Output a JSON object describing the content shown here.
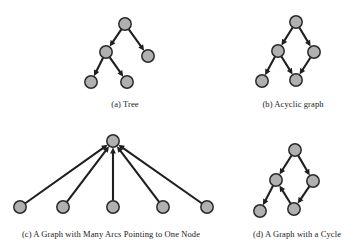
{
  "figure": {
    "background": "#ffffff",
    "node_fill": "#b0b0b0",
    "node_stroke": "#2a2a2a",
    "edge_color": "#1f1f1f",
    "node_radius": 6.2,
    "panels": [
      {
        "id": "a",
        "caption": "(a) Tree",
        "kind": "tree",
        "nodes": [
          {
            "id": "n1",
            "x": 125,
            "y": 24
          },
          {
            "id": "n2",
            "x": 106,
            "y": 52
          },
          {
            "id": "n3",
            "x": 148,
            "y": 56
          },
          {
            "id": "n4",
            "x": 91,
            "y": 82
          },
          {
            "id": "n5",
            "x": 127,
            "y": 82
          }
        ],
        "edges": [
          {
            "from": "n1",
            "to": "n2",
            "directed": true
          },
          {
            "from": "n1",
            "to": "n3",
            "directed": true
          },
          {
            "from": "n2",
            "to": "n4",
            "directed": true
          },
          {
            "from": "n2",
            "to": "n5",
            "directed": true
          }
        ]
      },
      {
        "id": "b",
        "caption": "(b) Acyclic graph",
        "kind": "acyclic",
        "nodes": [
          {
            "id": "n1",
            "x": 296,
            "y": 22
          },
          {
            "id": "n2",
            "x": 278,
            "y": 51
          },
          {
            "id": "n3",
            "x": 314,
            "y": 52
          },
          {
            "id": "n4",
            "x": 296,
            "y": 80
          },
          {
            "id": "n5",
            "x": 262,
            "y": 81
          }
        ],
        "edges": [
          {
            "from": "n1",
            "to": "n2",
            "directed": true
          },
          {
            "from": "n1",
            "to": "n3",
            "directed": true
          },
          {
            "from": "n2",
            "to": "n5",
            "directed": true
          },
          {
            "from": "n2",
            "to": "n4",
            "directed": true
          },
          {
            "from": "n3",
            "to": "n4",
            "directed": true
          }
        ]
      },
      {
        "id": "c",
        "caption": "(c) A Graph with Many Arcs Pointing to One Node",
        "kind": "in-hub",
        "nodes": [
          {
            "id": "hub",
            "x": 113,
            "y": 141
          },
          {
            "id": "l1",
            "x": 20,
            "y": 207
          },
          {
            "id": "l2",
            "x": 63,
            "y": 207
          },
          {
            "id": "l3",
            "x": 113,
            "y": 207
          },
          {
            "id": "l4",
            "x": 163,
            "y": 207
          },
          {
            "id": "l5",
            "x": 207,
            "y": 207
          }
        ],
        "edges": [
          {
            "from": "l1",
            "to": "hub",
            "directed": true
          },
          {
            "from": "l2",
            "to": "hub",
            "directed": true
          },
          {
            "from": "l3",
            "to": "hub",
            "directed": true
          },
          {
            "from": "l4",
            "to": "hub",
            "directed": true
          },
          {
            "from": "l5",
            "to": "hub",
            "directed": true
          }
        ]
      },
      {
        "id": "d",
        "caption": "(d) A Graph with a Cycle",
        "kind": "cyclic",
        "nodes": [
          {
            "id": "n1",
            "x": 295,
            "y": 150
          },
          {
            "id": "n2",
            "x": 276,
            "y": 180
          },
          {
            "id": "n3",
            "x": 313,
            "y": 181
          },
          {
            "id": "n4",
            "x": 294,
            "y": 209
          },
          {
            "id": "n5",
            "x": 260,
            "y": 211
          }
        ],
        "edges": [
          {
            "from": "n1",
            "to": "n2",
            "directed": true
          },
          {
            "from": "n1",
            "to": "n3",
            "directed": true
          },
          {
            "from": "n2",
            "to": "n5",
            "directed": true
          },
          {
            "from": "n3",
            "to": "n4",
            "directed": true
          },
          {
            "from": "n4",
            "to": "n2",
            "directed": true
          }
        ]
      }
    ]
  }
}
